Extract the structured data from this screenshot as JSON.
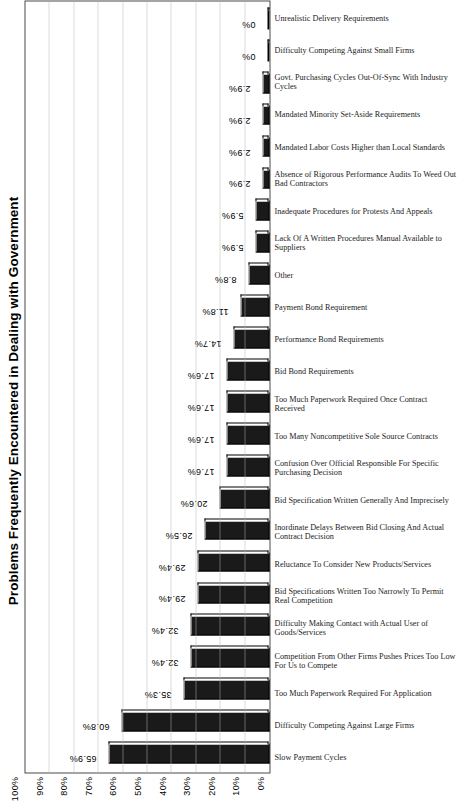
{
  "chart_data": {
    "type": "bar",
    "title": "Problems Frequently Encountered in Dealing with Government",
    "orientation": "vertical-rotated",
    "xlabel": "",
    "ylabel": "",
    "ylim": [
      0,
      100
    ],
    "grid": true,
    "legend": "none",
    "value_suffix": "%",
    "axis_ticks": [
      "0%",
      "10%",
      "20%",
      "30%",
      "40%",
      "50%",
      "60%",
      "70%",
      "80%",
      "90%",
      "100%"
    ],
    "categories": [
      "Slow Payment Cycles",
      "Difficulty Competing Against Large Firms",
      "Too Much Paperwork Required For Application",
      "Competition From Other Firms Pushes Prices Too Low For Us to Compete",
      "Difficulty Making Contact with Actual User of Goods/Services",
      "Bid Specifications Written Too Narrowly To Permit Real Competition",
      "Reluctance To Consider New Products/Services",
      "Inordinate Delays Between Bid Closing And Actual Contract Decision",
      "Bid Specification Written Generally And Imprecisely",
      "Confusion Over Official Responsible For Specific Purchasing Decision",
      "Too Many Noncompetitive Sole Source Contracts",
      "Too Much Paperwork Required Once Contract Received",
      "Bid Bond Requirements",
      "Performance Bond Requirements",
      "Payment Bond Requirement",
      "Other",
      "Lack Of A Written Procedures Manual Available to Suppliers",
      "Inadequate Procedures for Protests And Appeals",
      "Absence of Rigorous Performance Audits To Weed Out Bad Contractors",
      "Mandated Labor Costs Higher than Local Standards",
      "Mandated Minority Set-Aside Requirements",
      "Govt. Purchasing Cycles Out-Of-Sync With Industry Cycles",
      "Difficulty Competing Against Small Firms",
      "Unrealistic Delivery Requirements"
    ],
    "values": [
      65.9,
      60.8,
      35.3,
      32.4,
      32.4,
      29.4,
      29.4,
      26.5,
      20.6,
      17.6,
      17.6,
      17.6,
      17.6,
      14.7,
      11.8,
      8.8,
      5.9,
      5.9,
      2.9,
      2.9,
      2.9,
      2.9,
      0,
      0
    ],
    "value_labels": [
      "65.9%",
      "60.8%",
      "35.3%",
      "32.4%",
      "32.4%",
      "29.4%",
      "29.4%",
      "26.5%",
      "20.6%",
      "17.6%",
      "17.6%",
      "17.6%",
      "17.6%",
      "14.7%",
      "11.8%",
      "8.8%",
      "5.9%",
      "5.9%",
      "2.9%",
      "2.9%",
      "2.9%",
      "2.9%",
      "0%",
      "0%"
    ],
    "colors": {
      "bar_fill": "#1a1a1a",
      "bar_edge": "#000000",
      "grid": "#b6b6b6",
      "axis": "#4a4a4a",
      "background": "#ffffff",
      "text": "#000000"
    }
  }
}
